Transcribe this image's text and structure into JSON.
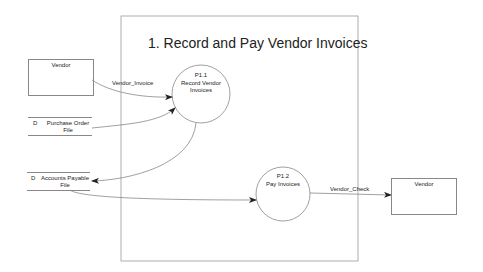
{
  "diagram": {
    "title": "1. Record and Pay Vendor Invoices",
    "processes": [
      {
        "id": "P1.1",
        "label": "Record Vendor Invoices",
        "line1": "Record Vendor",
        "line2": "Invoices"
      },
      {
        "id": "P1.2",
        "label": "Pay Invoices"
      }
    ],
    "external_entities": [
      {
        "label": "Vendor",
        "position": "left"
      },
      {
        "label": "Vendor",
        "position": "right"
      }
    ],
    "data_stores": [
      {
        "marker": "D",
        "line1": "Purchase Order",
        "line2": "File"
      },
      {
        "marker": "D",
        "line1": "Accounts Payable",
        "line2": "File"
      }
    ],
    "flows": [
      {
        "label": "Vendor_Invoice",
        "from": "Vendor",
        "to": "P1.1"
      },
      {
        "label": "",
        "from": "Purchase Order File",
        "to": "P1.1"
      },
      {
        "label": "",
        "from": "P1.1",
        "to": "Accounts Payable File"
      },
      {
        "label": "",
        "from": "Accounts Payable File",
        "to": "P1.2"
      },
      {
        "label": "Vendor_Check",
        "from": "P1.2",
        "to": "Vendor"
      }
    ],
    "colors": {
      "line": "#888888",
      "text": "#222222",
      "background": "#ffffff"
    }
  }
}
